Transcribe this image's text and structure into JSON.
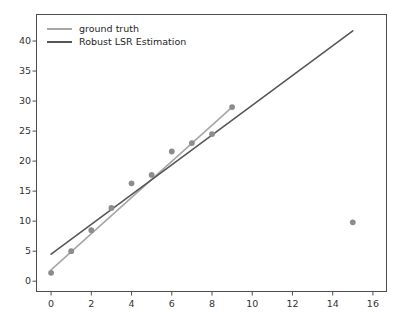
{
  "chart_data": {
    "type": "scatter",
    "title": "",
    "xlabel": "",
    "ylabel": "",
    "xlim": [
      -0.75,
      16.7
    ],
    "ylim": [
      -1.8,
      44.5
    ],
    "grid": false,
    "legend_position": "upper left",
    "xticks": [
      0,
      2,
      4,
      6,
      8,
      10,
      12,
      14,
      16
    ],
    "yticks": [
      0,
      5,
      10,
      15,
      20,
      25,
      30,
      35,
      40
    ],
    "points": {
      "name": "observations",
      "marker": "circle",
      "color": "#8c8c8c",
      "x": [
        0,
        1,
        2,
        3,
        4,
        5,
        6,
        7,
        8,
        9,
        15
      ],
      "y": [
        1.4,
        5.0,
        8.5,
        12.2,
        16.3,
        17.7,
        21.6,
        23.0,
        24.5,
        29.0,
        9.8
      ]
    },
    "series": [
      {
        "name": "ground truth",
        "type": "line",
        "color": "#a6a6a6",
        "linewidth": 1.6,
        "x": [
          0,
          9
        ],
        "y": [
          1.9,
          29.0
        ],
        "slope": 3.01,
        "intercept": 1.9
      },
      {
        "name": "Robust LSR Estimation",
        "type": "line",
        "color": "#575757",
        "linewidth": 1.6,
        "x": [
          0,
          15
        ],
        "y": [
          4.5,
          41.7
        ],
        "slope": 2.48,
        "intercept": 4.5
      }
    ]
  },
  "legend": {
    "items": [
      {
        "label": "ground truth",
        "color": "#a6a6a6"
      },
      {
        "label": "Robust LSR Estimation",
        "color": "#575757"
      }
    ]
  },
  "axis": {
    "x_tick_labels": [
      "0",
      "2",
      "4",
      "6",
      "8",
      "10",
      "12",
      "14",
      "16"
    ],
    "y_tick_labels": [
      "0",
      "5",
      "10",
      "15",
      "20",
      "25",
      "30",
      "35",
      "40"
    ]
  },
  "style": {
    "background": "#ffffff",
    "frame_color": "#4d4d4d",
    "tick_text_color": "#333333"
  }
}
